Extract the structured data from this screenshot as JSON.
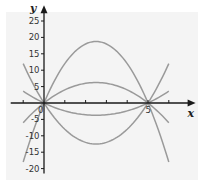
{
  "chart_data": {
    "type": "line",
    "title": "",
    "xlabel": "x",
    "ylabel": "y",
    "xlim": [
      -1.6,
      7
    ],
    "ylim": [
      -22,
      28
    ],
    "grid": false,
    "background": "#f4f4f4",
    "curve_color": "#9a9a9a",
    "axis_color": "#1a1a1a",
    "x_ticks": [
      -1,
      1,
      2,
      3,
      4,
      5,
      6
    ],
    "x_tick_labels": [
      {
        "value": 0,
        "text": "0"
      },
      {
        "value": 5,
        "text": "5"
      }
    ],
    "y_ticks": [
      25,
      20,
      15,
      10,
      5,
      -5,
      -10,
      -15,
      -20
    ],
    "y_tick_labels": [
      "25",
      "20",
      "15",
      "10",
      "5",
      "-5",
      "-10",
      "-15",
      "-20"
    ],
    "series": [
      {
        "name": "y = -3x(x-5)",
        "a": -3,
        "roots": [
          0,
          5
        ],
        "domain": [
          -1,
          6
        ],
        "vertex": [
          2.5,
          18.75
        ]
      },
      {
        "name": "y = -x(x-5)",
        "a": -1,
        "roots": [
          0,
          5
        ],
        "domain": [
          -1,
          6
        ],
        "vertex": [
          2.5,
          6.25
        ]
      },
      {
        "name": "y = 0.6x(x-5)",
        "a": 0.6,
        "roots": [
          0,
          5
        ],
        "domain": [
          -1,
          6
        ],
        "vertex": [
          2.5,
          -3.75
        ]
      },
      {
        "name": "y = 2x(x-5)",
        "a": 2,
        "roots": [
          0,
          5
        ],
        "domain": [
          -1,
          6
        ],
        "vertex": [
          2.5,
          -12.5
        ]
      }
    ]
  }
}
